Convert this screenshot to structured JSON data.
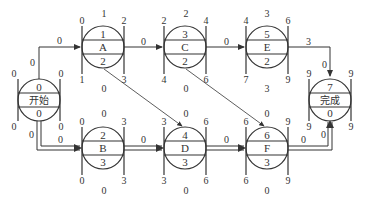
{
  "diagram": {
    "type": "network-schedule",
    "nodes": [
      {
        "id": "start",
        "name": "开始",
        "cx": 39,
        "cy": 100,
        "duration": "0",
        "total_float": "0",
        "es": "0",
        "ef": "0",
        "ls": "0",
        "lf": "0",
        "free_float": null,
        "top_float": null,
        "partial": true
      },
      {
        "id": "A",
        "name": "A",
        "cx": 103,
        "cy": 47,
        "duration": "1",
        "total_float": "2",
        "es": "0",
        "ef": "2",
        "ls": "1",
        "lf": "3",
        "top_label": "1",
        "bottom_label": "0"
      },
      {
        "id": "C",
        "name": "C",
        "cx": 185,
        "cy": 47,
        "duration": "3",
        "total_float": "2",
        "es": "2",
        "ef": "4",
        "ls": "4",
        "lf": "6",
        "top_label": "2",
        "bottom_label": "0"
      },
      {
        "id": "E",
        "name": "E",
        "cx": 267,
        "cy": 47,
        "duration": "5",
        "total_float": "2",
        "es": "4",
        "ef": "6",
        "ls": "7",
        "lf": "9",
        "top_label": "3",
        "bottom_label": "3"
      },
      {
        "id": "finish",
        "name": "完成",
        "cx": 330,
        "cy": 100,
        "duration": "7",
        "total_float": "0",
        "es": "9",
        "ef": "9",
        "ls": "9",
        "lf": "9"
      },
      {
        "id": "B",
        "name": "B",
        "cx": 103,
        "cy": 148,
        "duration": "2",
        "total_float": "3",
        "es": "0",
        "ef": "3",
        "ls": "0",
        "lf": "3",
        "top_label": "0",
        "bottom_label": "0"
      },
      {
        "id": "D",
        "name": "D",
        "cx": 185,
        "cy": 148,
        "duration": "4",
        "total_float": "3",
        "es": "3",
        "ef": "6",
        "ls": "3",
        "lf": "6",
        "top_label": "0",
        "bottom_label": "0"
      },
      {
        "id": "F",
        "name": "F",
        "cx": 267,
        "cy": 148,
        "duration": "6",
        "total_float": "3",
        "es": "6",
        "ef": "9",
        "ls": "6",
        "lf": "9",
        "top_label": "0",
        "bottom_label": "0"
      }
    ],
    "edges": [
      {
        "from": "start",
        "to": "A",
        "label": "0",
        "critical": false
      },
      {
        "from": "start",
        "to": "B",
        "label": "0",
        "critical": true
      },
      {
        "from": "A",
        "to": "C",
        "label": "0",
        "critical": false
      },
      {
        "from": "C",
        "to": "E",
        "label": "0",
        "critical": false
      },
      {
        "from": "E",
        "to": "finish",
        "label": "3",
        "label2": "0",
        "critical": false
      },
      {
        "from": "B",
        "to": "D",
        "label": "0",
        "critical": true
      },
      {
        "from": "D",
        "to": "F",
        "label": "0",
        "critical": true
      },
      {
        "from": "F",
        "to": "finish",
        "label": "0",
        "label2": "0",
        "critical": true
      },
      {
        "from": "A",
        "to": "D",
        "critical": false
      },
      {
        "from": "C",
        "to": "F",
        "critical": false
      }
    ],
    "start_labels": {
      "left_top": "0",
      "right_top": "0",
      "left_bottom": "0",
      "right_bottom": "0",
      "up_line": "0",
      "down_line_left": "0",
      "down_line_right": "0"
    }
  }
}
